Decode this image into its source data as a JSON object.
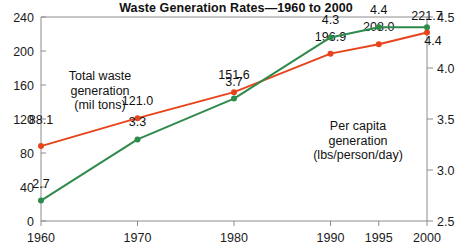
{
  "chart": {
    "title": "Waste Generation Rates—1960 to 2000"
  },
  "chart_data": {
    "type": "line",
    "title": "Waste Generation Rates—1960 to 2000",
    "xlabel": "",
    "ylabel": "",
    "grid": false,
    "legend_position": "inline-annotation",
    "categories": [
      "1960",
      "1970",
      "1980",
      "1990",
      "1995",
      "2000"
    ],
    "x": [
      1960,
      1970,
      1980,
      1990,
      1995,
      2000
    ],
    "x_positions": [
      0,
      1,
      2,
      3,
      3.5,
      4
    ],
    "axes": {
      "left": {
        "label": "Total waste generation (mil tons)",
        "ticks": [
          0,
          40,
          80,
          120,
          160,
          200,
          240
        ],
        "tick_labels": [
          "0",
          "40",
          "80",
          "120",
          "160",
          "200",
          "240"
        ],
        "ylim": [
          0,
          240
        ]
      },
      "right": {
        "label": "Per capita generation (lbs/person/day)",
        "ticks": [
          2.5,
          3.0,
          3.5,
          4.0,
          4.5
        ],
        "tick_labels": [
          "2.5",
          "3.0",
          "3.5",
          "4.0",
          "4.5"
        ],
        "ylim": [
          2.5,
          4.5
        ]
      }
    },
    "series": [
      {
        "name": "Total waste generation (mil tons)",
        "axis": "left",
        "color": "#E8441C",
        "values": [
          88.1,
          121.0,
          151.6,
          196.9,
          208.0,
          221.7
        ],
        "data_labels": [
          "88.1",
          "121.0",
          "151.6",
          "196.9",
          "208.0",
          "221.7"
        ]
      },
      {
        "name": "Per capita generation (lbs/person/day)",
        "axis": "right",
        "color": "#2F8B4B",
        "values": [
          2.7,
          3.3,
          3.7,
          4.3,
          4.4,
          4.4
        ],
        "data_labels": [
          "2.7",
          "3.3",
          "3.7",
          "4.3",
          "4.4",
          "4.4"
        ]
      }
    ],
    "annotations": [
      {
        "name": "total-waste-annotation",
        "lines": [
          "Total waste",
          "generation",
          "(mil tons)"
        ],
        "align": "middle",
        "x_px": 100,
        "y_px": 80
      },
      {
        "name": "per-capita-annotation",
        "lines": [
          "Per capita",
          "generation",
          "(lbs/person/day)"
        ],
        "align": "middle",
        "x_px": 358,
        "y_px": 130
      }
    ],
    "colors": {
      "total_waste": "#E8441C",
      "per_capita": "#2F8B4B",
      "frame": "#8c8c8c",
      "text": "#111111",
      "background": "#ffffff"
    }
  }
}
